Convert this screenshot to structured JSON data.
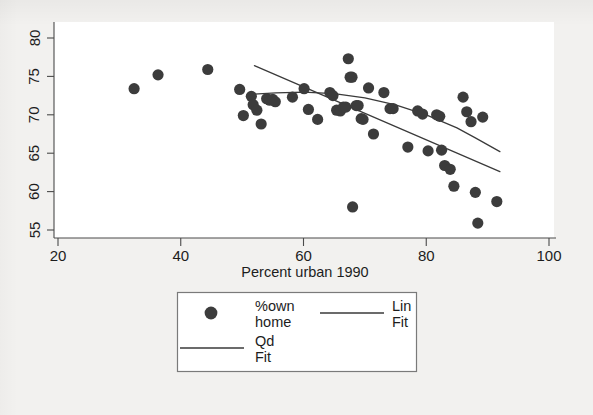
{
  "chart_data": {
    "type": "scatter",
    "title": "",
    "xlabel": "Percent urban 1990",
    "ylabel": "",
    "xlim": [
      20,
      100
    ],
    "ylim": [
      54.0,
      80.8
    ],
    "xticks": [
      20,
      40,
      60,
      80,
      100
    ],
    "yticks": [
      55,
      60,
      65,
      70,
      75,
      80
    ],
    "xtick_labels": [
      "20",
      "40",
      "60",
      "80",
      "100"
    ],
    "ytick_labels": [
      "55",
      "60",
      "65",
      "70",
      "75",
      "80"
    ],
    "grid": false,
    "legend_position": "below-axes",
    "series": [
      {
        "name": "%own home",
        "type": "scatter",
        "marker": "filled-circle",
        "color": "#3c3c3c",
        "points": [
          [
            32.4,
            73.4
          ],
          [
            36.3,
            75.2
          ],
          [
            44.4,
            75.9
          ],
          [
            49.6,
            73.3
          ],
          [
            50.2,
            69.9
          ],
          [
            51.5,
            72.4
          ],
          [
            51.8,
            71.3
          ],
          [
            52.4,
            70.6
          ],
          [
            53.1,
            68.8
          ],
          [
            54.0,
            72.1
          ],
          [
            54.5,
            71.9
          ],
          [
            55.0,
            72.0
          ],
          [
            55.4,
            71.7
          ],
          [
            58.2,
            72.3
          ],
          [
            60.1,
            73.4
          ],
          [
            60.8,
            70.7
          ],
          [
            62.3,
            69.4
          ],
          [
            64.3,
            72.9
          ],
          [
            64.8,
            72.5
          ],
          [
            65.4,
            70.6
          ],
          [
            66.0,
            70.5
          ],
          [
            66.5,
            71.0
          ],
          [
            66.9,
            71.0
          ],
          [
            67.3,
            77.3
          ],
          [
            67.6,
            74.9
          ],
          [
            67.9,
            74.9
          ],
          [
            68.0,
            58.0
          ],
          [
            68.6,
            71.2
          ],
          [
            68.9,
            71.2
          ],
          [
            69.4,
            69.5
          ],
          [
            69.7,
            69.4
          ],
          [
            70.6,
            73.5
          ],
          [
            71.4,
            67.5
          ],
          [
            73.1,
            72.9
          ],
          [
            74.1,
            70.8
          ],
          [
            74.6,
            70.8
          ],
          [
            77.0,
            65.8
          ],
          [
            78.6,
            70.5
          ],
          [
            79.4,
            70.1
          ],
          [
            80.3,
            65.3
          ],
          [
            81.7,
            70.0
          ],
          [
            82.2,
            69.8
          ],
          [
            82.5,
            65.4
          ],
          [
            83.0,
            63.4
          ],
          [
            83.9,
            62.9
          ],
          [
            84.5,
            60.7
          ],
          [
            86.0,
            72.3
          ],
          [
            86.6,
            70.4
          ],
          [
            87.3,
            69.1
          ],
          [
            88.0,
            59.9
          ],
          [
            88.4,
            55.9
          ],
          [
            89.2,
            69.7
          ],
          [
            91.5,
            58.7
          ]
        ]
      },
      {
        "name": "Lin Fit",
        "type": "line",
        "color": "#3a3a3a",
        "points": [
          [
            52.0,
            76.4
          ],
          [
            92.0,
            62.6
          ]
        ]
      },
      {
        "name": "Qd Fit",
        "type": "line",
        "color": "#3a3a3a",
        "points": [
          [
            51.8,
            72.7
          ],
          [
            55.5,
            72.85
          ],
          [
            60.0,
            72.95
          ],
          [
            65.0,
            72.75
          ],
          [
            70.0,
            72.2
          ],
          [
            75.0,
            71.3
          ],
          [
            80.0,
            70.0
          ],
          [
            85.0,
            68.3
          ],
          [
            88.0,
            67.0
          ],
          [
            92.0,
            65.2
          ]
        ]
      }
    ]
  },
  "legend": {
    "entries": [
      {
        "label_line1": "%own",
        "label_line2": "home",
        "symbol": "marker-dot"
      },
      {
        "label_line1": "Lin",
        "label_line2": "Fit",
        "symbol": "line-rule"
      },
      {
        "label_line1": "Qd",
        "label_line2": "Fit",
        "symbol": "line-rule"
      }
    ]
  }
}
